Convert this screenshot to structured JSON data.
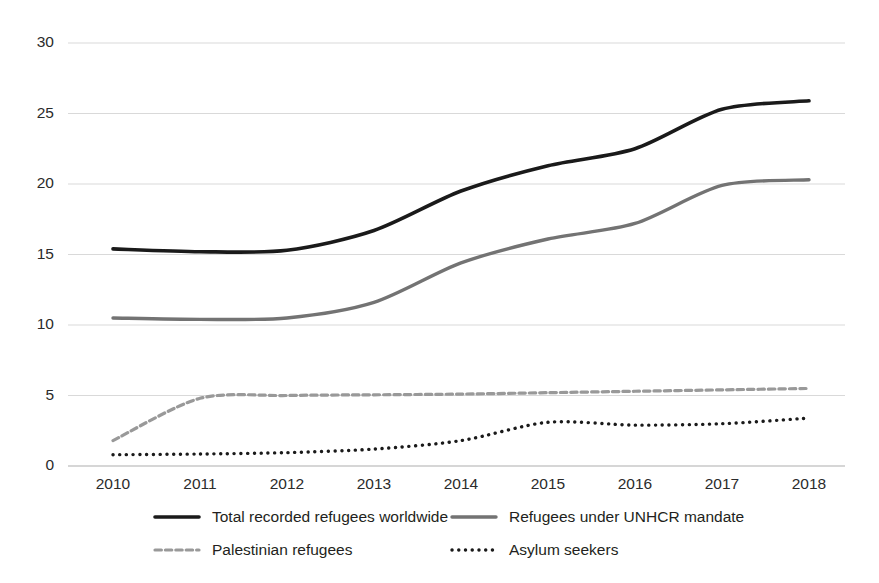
{
  "chart_data": {
    "type": "line",
    "title": "",
    "subtitle": "",
    "xlabel": "",
    "ylabel": "",
    "categories": [
      "2010",
      "2011",
      "2012",
      "2013",
      "2014",
      "2015",
      "2016",
      "2017",
      "2018"
    ],
    "x": [
      2010,
      2011,
      2012,
      2013,
      2014,
      2015,
      2016,
      2017,
      2018
    ],
    "xlim": [
      2010,
      2018
    ],
    "ylim": [
      0,
      30
    ],
    "yticks": [
      0,
      5,
      10,
      15,
      20,
      25,
      30
    ],
    "ytick_labels": [
      "0",
      "5",
      "10",
      "15",
      "20",
      "25",
      "30"
    ],
    "grid": "horizontal",
    "legend_position": "bottom",
    "series": [
      {
        "name": "Total recorded refugees worldwide",
        "values": [
          15.4,
          15.2,
          15.3,
          16.7,
          19.5,
          21.3,
          22.5,
          25.3,
          25.9
        ],
        "color": "#1a1a1a",
        "style": "solid",
        "width": 3.6
      },
      {
        "name": "Refugees under UNHCR mandate",
        "values": [
          10.5,
          10.4,
          10.5,
          11.6,
          14.4,
          16.1,
          17.2,
          19.9,
          20.3
        ],
        "color": "#737373",
        "style": "solid",
        "width": 3.4
      },
      {
        "name": "Palestinian refugees",
        "values": [
          1.8,
          4.8,
          5.0,
          5.05,
          5.1,
          5.2,
          5.3,
          5.4,
          5.5
        ],
        "color": "#999999",
        "style": "dashed",
        "width": 3.2
      },
      {
        "name": "Asylum seekers",
        "values": [
          0.8,
          0.85,
          0.95,
          1.2,
          1.8,
          3.1,
          2.9,
          3.0,
          3.4
        ],
        "color": "#1a1a1a",
        "style": "dotted",
        "width": 3.4
      }
    ]
  },
  "legend": {
    "items": [
      {
        "label": "Total recorded refugees worldwide"
      },
      {
        "label": "Refugees under UNHCR mandate"
      },
      {
        "label": "Palestinian refugees"
      },
      {
        "label": "Asylum seekers"
      }
    ]
  },
  "layout": {
    "plot_left": 68,
    "plot_right": 845,
    "plot_top": 43,
    "plot_bottom": 466,
    "x_first_tick": 113,
    "x_tick_spacing": 87,
    "legend_rows": [
      {
        "y": 517,
        "items": [
          {
            "marker_x": 155,
            "label_x": 212
          },
          {
            "marker_x": 452,
            "label_x": 509
          }
        ]
      },
      {
        "y": 550,
        "items": [
          {
            "marker_x": 155,
            "label_x": 212
          },
          {
            "marker_x": 452,
            "label_x": 509
          }
        ]
      }
    ]
  },
  "colors": {
    "background": "#ffffff",
    "gridline": "#d9d9d9",
    "axis": "#c9c9c9",
    "text": "#231f20",
    "series_black": "#1a1a1a",
    "series_gray": "#737373",
    "series_lightgray": "#999999"
  }
}
